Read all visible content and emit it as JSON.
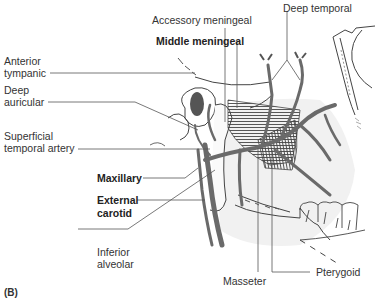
{
  "figure": {
    "panel_label": "(B)",
    "labels": {
      "accessory_meningeal": "Accessory meningeal",
      "deep_temporal": "Deep temporal",
      "middle_meningeal": "Middle meningeal",
      "anterior_tympanic_1": "Anterior",
      "anterior_tympanic_2": "tympanic",
      "deep_auricular_1": "Deep",
      "deep_auricular_2": "auricular",
      "superficial_temporal_1": "Superficial",
      "superficial_temporal_2": "temporal artery",
      "maxillary": "Maxillary",
      "external_carotid_1": "External",
      "external_carotid_2": "carotid",
      "inferior_alveolar_1": "Inferior",
      "inferior_alveolar_2": "alveolar",
      "masseter": "Masseter",
      "pterygoid": "Pterygoid"
    }
  }
}
